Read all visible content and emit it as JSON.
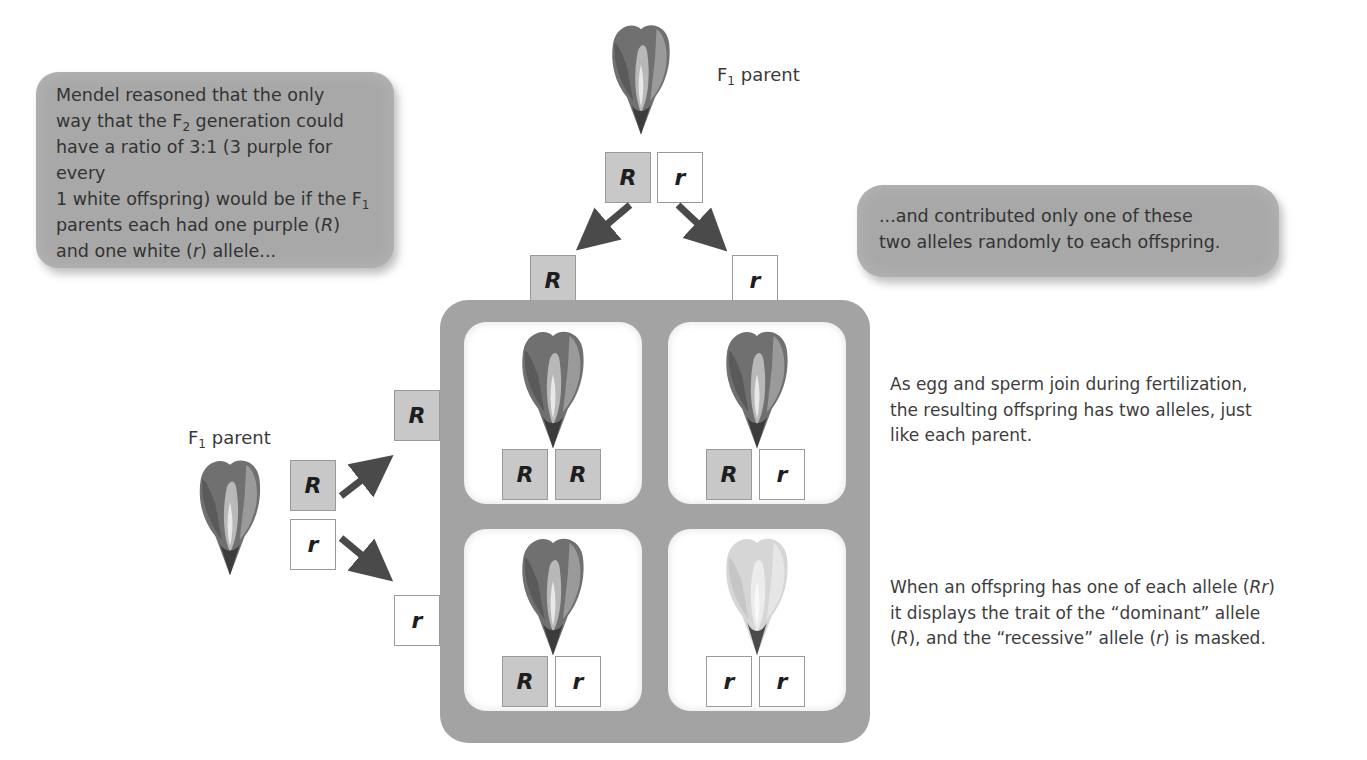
{
  "callouts": {
    "left": {
      "lines": [
        "Mendel reasoned that the only",
        "way that the F",
        "2",
        " generation could",
        "have a ratio of 3:1 (3 purple for every",
        "1 white offspring) would be if the F",
        "1",
        "parents each had one purple (",
        "R",
        ")",
        "and one white (",
        "r",
        ") allele..."
      ]
    },
    "right": {
      "line1": "...and contributed only one of these",
      "line2": "two alleles randomly to each offspring."
    }
  },
  "annotations": {
    "fertilization": {
      "line1": "As egg and sperm join during fertilization,",
      "line2": "the resulting offspring has two alleles, just",
      "line3": "like each parent."
    },
    "dominance": {
      "line1a": "When an offspring has one of each allele (",
      "line1b": "Rr",
      "line1c": ")",
      "line2": "it displays the trait of the “dominant” allele",
      "line3a": "(",
      "line3b": "R",
      "line3c": "), and the “recessive” allele (",
      "line3d": "r",
      "line3e": ") is masked."
    }
  },
  "parents": {
    "top": {
      "label_main": "F",
      "label_sub": "1",
      "label_rest": " parent",
      "alleles": [
        "R",
        "r"
      ],
      "flower": "purple"
    },
    "left": {
      "label_main": "F",
      "label_sub": "1",
      "label_rest": " parent",
      "alleles": [
        "R",
        "r"
      ],
      "flower": "purple"
    }
  },
  "gametes": {
    "top": [
      "R",
      "r"
    ],
    "left": [
      "R",
      "r"
    ]
  },
  "punnett": {
    "cells": [
      {
        "position": "top-left",
        "alleles": [
          "R",
          "R"
        ],
        "flower": "purple"
      },
      {
        "position": "top-right",
        "alleles": [
          "R",
          "r"
        ],
        "flower": "purple"
      },
      {
        "position": "bottom-left",
        "alleles": [
          "R",
          "r"
        ],
        "flower": "purple"
      },
      {
        "position": "bottom-right",
        "alleles": [
          "r",
          "r"
        ],
        "flower": "white"
      }
    ]
  },
  "colors": {
    "dominant_box": "#c8c8c8",
    "recessive_box": "#ffffff",
    "punnett_frame": "#a3a3a3",
    "callout_bg": "#a8a8a8",
    "arrow": "#4a4a4a",
    "purple_flower": "#6e6e6e",
    "white_flower": "#d4d4d4"
  }
}
